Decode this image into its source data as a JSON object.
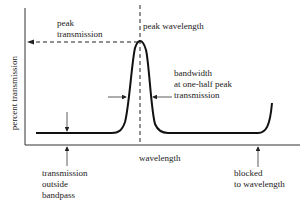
{
  "diagram": {
    "type": "bandpass filter transmission curve",
    "axes": {
      "y_label": "percent transmission",
      "x_label": "wavelength"
    },
    "annotations": {
      "peak_transmission": [
        "peak",
        "transmission"
      ],
      "peak_wavelength": "peak wavelength",
      "bandwidth": [
        "bandwidth",
        "at one-half peak",
        "transmission"
      ],
      "outside_bandpass": [
        "transmission",
        "outside",
        "bandpass"
      ],
      "blocked": [
        "blocked",
        "to wavelength"
      ]
    },
    "colors": {
      "line": "#111111",
      "text": "#222222",
      "background": "#ffffff"
    }
  }
}
